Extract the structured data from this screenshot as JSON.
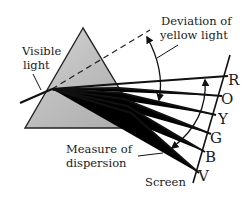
{
  "diagram": {
    "labels": {
      "visible_light_line1": "Visible",
      "visible_light_line2": "light",
      "deviation_line1": "Deviation of",
      "deviation_line2": "yellow light",
      "measure_line1": "Measure of",
      "measure_line2": "dispersion",
      "screen": "Screen"
    },
    "colors": {
      "R": "R",
      "O": "O",
      "Y": "Y",
      "G": "G",
      "B": "B",
      "V": "V"
    },
    "style": {
      "prism_fill": "#c9c9c9",
      "line_color": "#111111"
    }
  }
}
